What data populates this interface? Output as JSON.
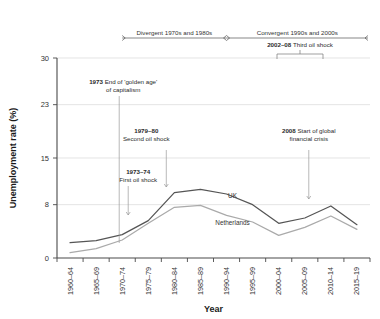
{
  "chart_data": {
    "type": "line",
    "title": "",
    "xlabel": "Year",
    "ylabel": "Unemployment rate (%)",
    "categories": [
      "1960–64",
      "1965–69",
      "1970–74",
      "1975–79",
      "1980–84",
      "1985–89",
      "1990–94",
      "1995–99",
      "2000–04",
      "2005–09",
      "2010–14",
      "2015–19"
    ],
    "ylim": [
      0,
      30
    ],
    "yticks": [
      0,
      8,
      15,
      23,
      30
    ],
    "ytick_labels": [
      "0",
      "8",
      "15",
      "23",
      "30"
    ],
    "grid": true,
    "legend_position": "inline-labels",
    "series": [
      {
        "name": "UK",
        "color": "#555555",
        "values": [
          2.3,
          2.6,
          3.5,
          5.6,
          9.8,
          10.3,
          9.6,
          8.0,
          5.2,
          6.0,
          7.8,
          5.0
        ],
        "label_x_category": "1990–94",
        "label_value": 9.0
      },
      {
        "name": "Netherlands",
        "color": "#aaaaaa",
        "values": [
          0.8,
          1.4,
          2.7,
          5.2,
          7.6,
          7.9,
          6.4,
          5.4,
          3.4,
          4.6,
          6.3,
          4.3
        ],
        "label_x_category": "1990–94",
        "label_value": 5.0
      }
    ],
    "eras": [
      {
        "label": "Divergent 1970s and 1980s",
        "start_category": "1970–74",
        "end_category": "1990–94"
      },
      {
        "label": "Convergent 1990s and 2000s",
        "start_category": "1990–94",
        "end_category": "2015–19"
      }
    ],
    "annotations": [
      {
        "id": "golden-age",
        "bold": "1973",
        "text": "End of 'golden age'",
        "text2": "of capitalism",
        "x_category": "1970–74"
      },
      {
        "id": "first-oil-shock",
        "bold": "1973–74",
        "text": "First oil shock",
        "text2": "",
        "x_category": "1970–74"
      },
      {
        "id": "second-oil-shock",
        "bold": "1979–80",
        "text": "Second oil shock",
        "text2": "",
        "x_category": "1975–79"
      },
      {
        "id": "third-oil-shock",
        "bold": "2002–08",
        "text": "Third oil shock",
        "text2": "",
        "x_category": "2002–08"
      },
      {
        "id": "financial-crisis",
        "bold": "2008",
        "text": "Start of global",
        "text2": "financial crisis",
        "x_category": "2005–09"
      }
    ]
  }
}
